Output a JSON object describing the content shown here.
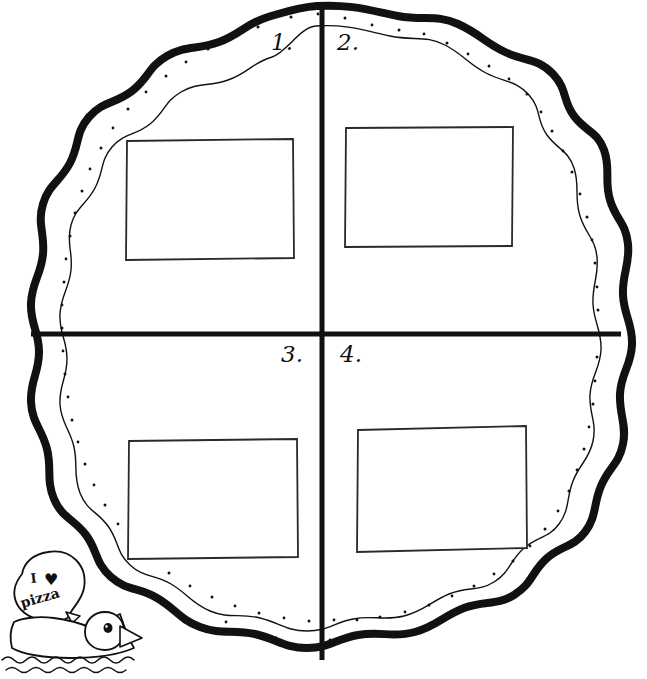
{
  "worksheet": {
    "title": "Pizza Quadrants Worksheet",
    "shape_name": "pizza",
    "background_color": "#ffffff",
    "ink_color": "#111111",
    "crust_outline_color": "#111111",
    "quadrants": [
      {
        "id": "q1",
        "label": "1.",
        "position": "top-left",
        "box_label": ""
      },
      {
        "id": "q2",
        "label": "2.",
        "position": "top-right",
        "box_label": ""
      },
      {
        "id": "q3",
        "label": "3.",
        "position": "bottom-left",
        "box_label": ""
      },
      {
        "id": "q4",
        "label": "4.",
        "position": "bottom-right",
        "box_label": ""
      }
    ],
    "mascot": {
      "name": "duck",
      "speech_line_1": "I",
      "speech_heart": "♥",
      "speech_line_2": "pizza",
      "water_label": "water"
    }
  }
}
